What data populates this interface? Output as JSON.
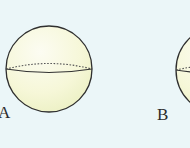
{
  "figure": {
    "spheres": [
      {
        "label": "A",
        "cx": 49,
        "cy": 70,
        "r": 43
      },
      {
        "label": "B",
        "cx": 220,
        "cy": 70,
        "r": 44
      }
    ],
    "colors": {
      "background": "#ebf6f8",
      "sphere_fill_light": "#fbfbee",
      "sphere_fill_dark": "#eef2c6",
      "outline": "#2f2f2f"
    }
  }
}
